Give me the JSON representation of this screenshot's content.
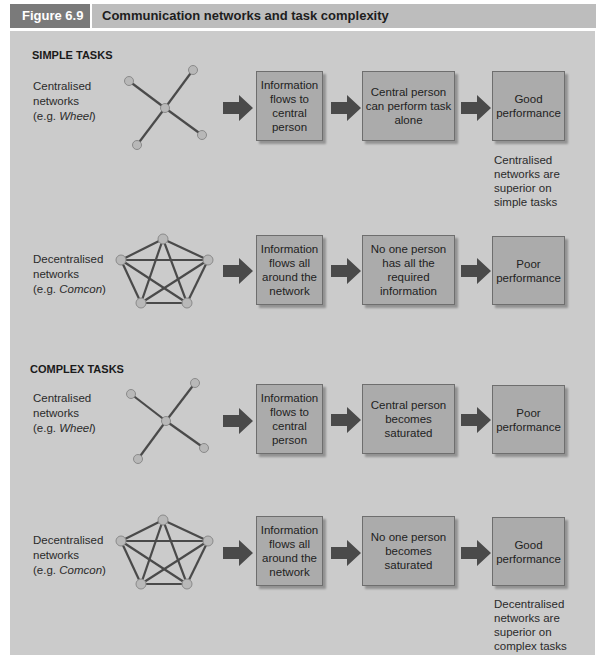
{
  "header": {
    "figure_label": "Figure 6.9",
    "title": "Communication networks and task complexity"
  },
  "sections": [
    {
      "title": "SIMPLE TASKS",
      "rows": [
        {
          "network_label_line1": "Centralised",
          "network_label_line2": "networks",
          "network_label_prefix": "(e.g. ",
          "network_example": "Wheel",
          "network_label_suffix": ")",
          "network_icon": "wheel-network",
          "steps": [
            "Information flows to central person",
            "Central person can perform task alone",
            "Good performance"
          ],
          "note": "Centralised networks are superior on simple tasks"
        },
        {
          "network_label_line1": "Decentralised",
          "network_label_line2": "networks",
          "network_label_prefix": "(e.g. ",
          "network_example": "Comcon",
          "network_label_suffix": ")",
          "network_icon": "comcon-network",
          "steps": [
            "Information flows all around the network",
            "No one person has all the required information",
            "Poor performance"
          ],
          "note": ""
        }
      ]
    },
    {
      "title": "COMPLEX TASKS",
      "rows": [
        {
          "network_label_line1": "Centralised",
          "network_label_line2": "networks",
          "network_label_prefix": "(e.g. ",
          "network_example": "Wheel",
          "network_label_suffix": ")",
          "network_icon": "wheel-network",
          "steps": [
            "Information flows to central person",
            "Central person becomes saturated",
            "Poor performance"
          ],
          "note": ""
        },
        {
          "network_label_line1": "Decentralised",
          "network_label_line2": "networks",
          "network_label_prefix": "(e.g. ",
          "network_example": "Comcon",
          "network_label_suffix": ")",
          "network_icon": "comcon-network",
          "steps": [
            "Information flows all around the network",
            "No one person becomes saturated",
            "Good performance"
          ],
          "note": "Decentralised networks are superior on complex tasks"
        }
      ]
    }
  ],
  "colors": {
    "panel_bg": "#cbcbcb",
    "box_fill": "#ababab",
    "arrow": "#4a4a4a",
    "node_fill": "#b8b8b8",
    "edge": "#4a4a4a",
    "figure_tab": "#7a7a7a",
    "title_bar": "#bdbdbd"
  }
}
